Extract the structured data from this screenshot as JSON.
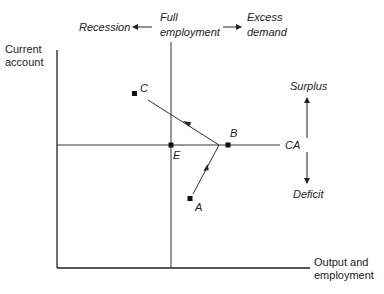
{
  "diagram": {
    "type": "economic-phase-diagram",
    "axes": {
      "y_label_line1": "Current",
      "y_label_line2": "account",
      "x_label_line1": "Output and",
      "x_label_line2": "employment"
    },
    "top_labels": {
      "recession": "Recession",
      "full_line1": "Full",
      "full_line2": "employment",
      "excess_line1": "Excess",
      "excess_line2": "demand"
    },
    "right_labels": {
      "ca": "CA",
      "surplus": "Surplus",
      "deficit": "Deficit"
    },
    "points": {
      "A": "A",
      "B": "B",
      "C": "C",
      "E": "E"
    },
    "colors": {
      "line": "#333333",
      "marker": "#111111",
      "text": "#222222"
    }
  }
}
